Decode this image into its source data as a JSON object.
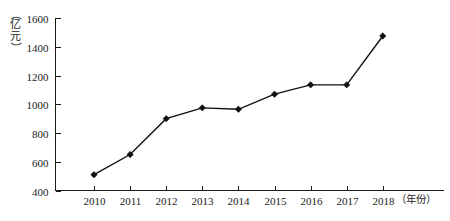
{
  "chart_data": {
    "type": "line",
    "title": "",
    "subtitle": "",
    "xlabel": "（年份）",
    "ylabel": "（亿元）",
    "categories": [
      "2010",
      "2011",
      "2012",
      "2013",
      "2014",
      "2015",
      "2016",
      "2017",
      "2018"
    ],
    "values": [
      510,
      650,
      900,
      975,
      965,
      1070,
      1135,
      1135,
      1475
    ],
    "series": [
      {
        "name": "",
        "values": [
          510,
          650,
          900,
          975,
          965,
          1070,
          1135,
          1135,
          1475
        ]
      }
    ],
    "ylim": [
      400,
      1600
    ],
    "ytick_labels": [
      "400",
      "600",
      "800",
      "1000",
      "1200",
      "1400",
      "1600"
    ],
    "ytick_values": [
      400,
      600,
      800,
      1000,
      1200,
      1400,
      1600
    ],
    "xtick_labels": [
      "2010",
      "2011",
      "2012",
      "2013",
      "2014",
      "2015",
      "2016",
      "2017",
      "2018"
    ],
    "grid": false,
    "legend": false,
    "legend_position": "none",
    "marker": "diamond",
    "line_color": "#111111",
    "marker_color": "#111111",
    "background_color": "#ffffff",
    "annotations": []
  },
  "axis_caption": {
    "y_open_paren": "（",
    "y_char_1": "亿",
    "y_char_2": "元",
    "y_close_paren": "）",
    "x_label": "（年份）"
  }
}
